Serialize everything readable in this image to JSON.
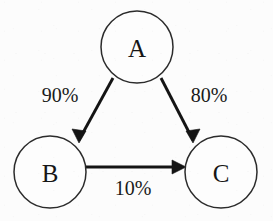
{
  "diagram": {
    "type": "directed-graph",
    "background_color": "#fcfcfc",
    "node_fill_color": "#fdfdfd",
    "node_stroke_color": "#2b2b2b",
    "edge_color": "#141414",
    "nodes": [
      {
        "id": "A",
        "label": "A",
        "cx": 137,
        "cy": 47,
        "r": 36
      },
      {
        "id": "B",
        "label": "B",
        "cx": 50,
        "cy": 172,
        "r": 36
      },
      {
        "id": "C",
        "label": "C",
        "cx": 221,
        "cy": 172,
        "r": 36
      }
    ],
    "edges": [
      {
        "id": "a-to-b",
        "from": "A",
        "to": "B",
        "label": "90%",
        "label_x": 60,
        "label_y": 95,
        "line": {
          "x1": 113,
          "y1": 78,
          "x2": 79,
          "y2": 140
        },
        "head": "79,143 72,129 86,131"
      },
      {
        "id": "a-to-c",
        "from": "A",
        "to": "C",
        "label": "80%",
        "label_x": 209,
        "label_y": 95,
        "line": {
          "x1": 161,
          "y1": 78,
          "x2": 193,
          "y2": 140
        },
        "head": "193,143 186,131 200,129"
      },
      {
        "id": "b-to-c",
        "from": "B",
        "to": "C",
        "label": "10%",
        "label_x": 133,
        "label_y": 188,
        "line": {
          "x1": 86,
          "y1": 167,
          "x2": 182,
          "y2": 167
        },
        "head": "186,167 172,160 172,174"
      }
    ]
  }
}
